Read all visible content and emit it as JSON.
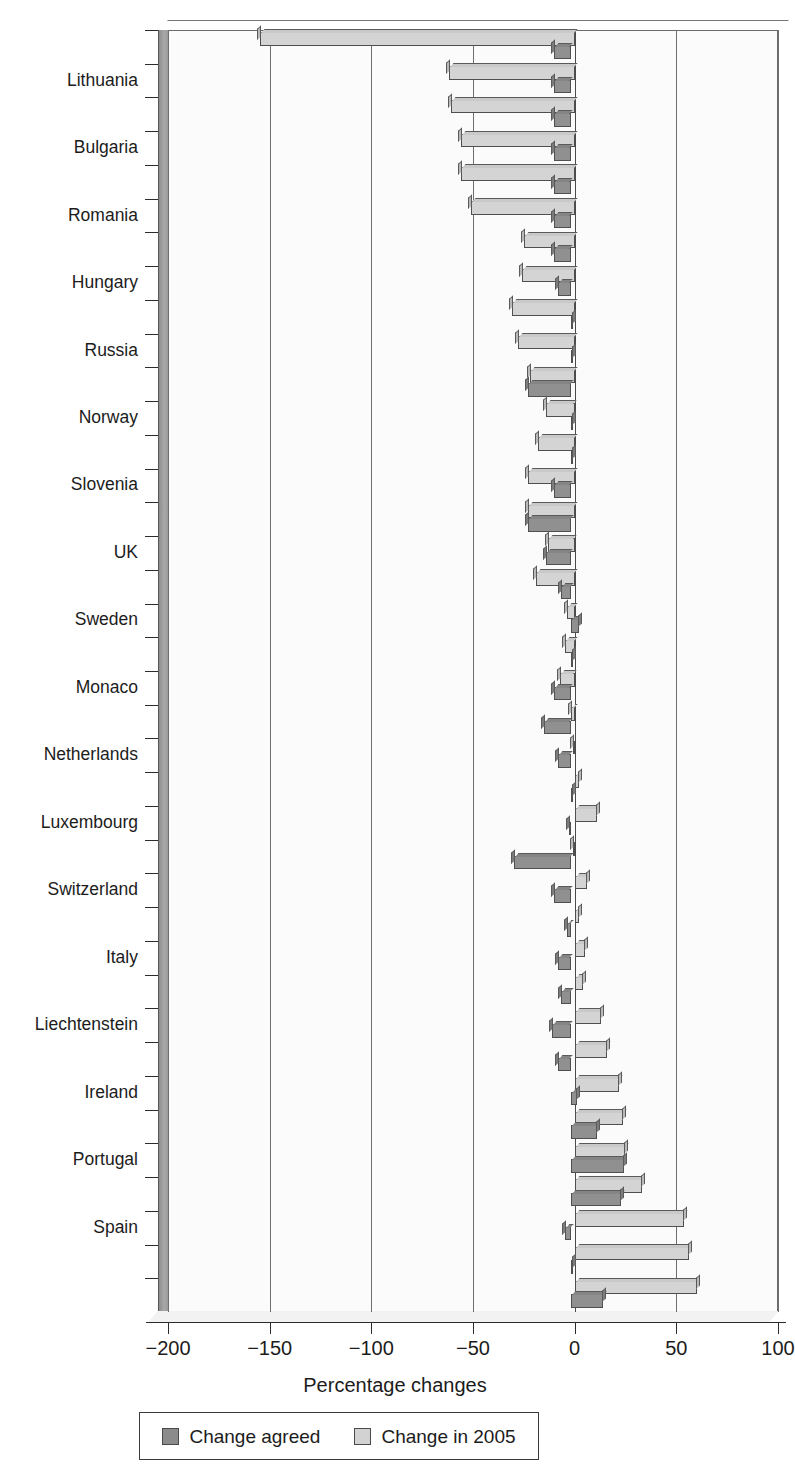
{
  "chart_data": {
    "type": "bar",
    "orientation": "horizontal",
    "title": "",
    "xlabel": "Percentage changes",
    "ylabel": "",
    "xlim": [
      -200,
      100
    ],
    "xticks": [
      -200,
      -150,
      -100,
      -50,
      0,
      50,
      100
    ],
    "xticklabels": [
      "−200",
      "−150",
      "−100",
      "−50",
      "0",
      "50",
      "100"
    ],
    "grid": "vertical",
    "legend_position": "bottom",
    "colors": {
      "change_agreed": "#909090",
      "change_2005": "#d4d4d4",
      "axis": "#2b2b2b",
      "grid": "#6f6f6f",
      "plot_background": "#fbfbfb",
      "wall": "#a0a0a0"
    },
    "legend": [
      {
        "key": "change_agreed",
        "label": "Change agreed",
        "swatch": "swatch-dark"
      },
      {
        "key": "change_2005",
        "label": "Change in 2005",
        "swatch": "swatch-light"
      }
    ],
    "series": [
      {
        "name": "Change agreed",
        "key": "change_agreed"
      },
      {
        "name": "Change in 2005",
        "key": "change_2005"
      }
    ],
    "categories": [
      "Estonia",
      "Lithuania",
      "Latvia",
      "Bulgaria",
      "Slovakia",
      "Romania",
      "Czech Republic",
      "Hungary",
      "Ukraine",
      "Russia",
      "Germany",
      "Norway",
      "Finland",
      "Slovenia",
      "Denmark",
      "UK",
      "Croatia",
      "Sweden",
      "Belarus",
      "Monaco",
      "Austria",
      "Netherlands",
      "France",
      "Luxembourg",
      "Belgium",
      "Switzerland",
      "Cyprus",
      "Italy",
      "Greece",
      "Liechtenstein",
      "Poland",
      "Ireland",
      "Malta",
      "Portugal",
      "Turkey",
      "Spain",
      "Iceland",
      "Albania"
    ],
    "rows": [
      {
        "label": "Estonia",
        "change_2005": -155,
        "change_agreed": -8
      },
      {
        "label": "Lithuania",
        "change_2005": -62,
        "change_agreed": -8
      },
      {
        "label": "Latvia",
        "change_2005": -61,
        "change_agreed": -8
      },
      {
        "label": "Bulgaria",
        "change_2005": -56,
        "change_agreed": -8
      },
      {
        "label": "Slovakia",
        "change_2005": -56,
        "change_agreed": -8
      },
      {
        "label": "Romania",
        "change_2005": -51,
        "change_agreed": -8
      },
      {
        "label": "Czech Republic",
        "change_2005": -25,
        "change_agreed": -8
      },
      {
        "label": "Hungary",
        "change_2005": -26,
        "change_agreed": -6
      },
      {
        "label": "Ukraine",
        "change_2005": -31,
        "change_agreed": 0
      },
      {
        "label": "Russia",
        "change_2005": -28,
        "change_agreed": 0
      },
      {
        "label": "Germany",
        "change_2005": -22,
        "change_agreed": -21
      },
      {
        "label": "Norway",
        "change_2005": -14,
        "change_agreed": 1
      },
      {
        "label": "Finland",
        "change_2005": -18,
        "change_agreed": 0
      },
      {
        "label": "Slovenia",
        "change_2005": -23,
        "change_agreed": -8
      },
      {
        "label": "Denmark",
        "change_2005": -23,
        "change_agreed": -21
      },
      {
        "label": "UK",
        "change_2005": -13,
        "change_agreed": -12
      },
      {
        "label": "Croatia",
        "change_2005": -19,
        "change_agreed": -5
      },
      {
        "label": "Sweden",
        "change_2005": -4,
        "change_agreed": 4
      },
      {
        "label": "Belarus",
        "change_2005": -5,
        "change_agreed": 0
      },
      {
        "label": "Monaco",
        "change_2005": -7,
        "change_agreed": -8
      },
      {
        "label": "Austria",
        "change_2005": -2,
        "change_agreed": -13
      },
      {
        "label": "Netherlands",
        "change_2005": -1,
        "change_agreed": -6
      },
      {
        "label": "France",
        "change_2005": 2,
        "change_agreed": 0
      },
      {
        "label": "Luxembourg",
        "change_2005": 11,
        "change_agreed": -1
      },
      {
        "label": "Belgium",
        "change_2005": -1,
        "change_agreed": -28
      },
      {
        "label": "Switzerland",
        "change_2005": 6,
        "change_agreed": -8
      },
      {
        "label": "Cyprus",
        "change_2005": 2,
        "change_agreed": -2
      },
      {
        "label": "Italy",
        "change_2005": 5,
        "change_agreed": -6
      },
      {
        "label": "Greece",
        "change_2005": 4,
        "change_agreed": -5
      },
      {
        "label": "Liechtenstein",
        "change_2005": 13,
        "change_agreed": -9
      },
      {
        "label": "Poland",
        "change_2005": 16,
        "change_agreed": -6
      },
      {
        "label": "Ireland",
        "change_2005": 22,
        "change_agreed": 3
      },
      {
        "label": "Malta",
        "change_2005": 24,
        "change_agreed": 13
      },
      {
        "label": "Portugal",
        "change_2005": 25,
        "change_agreed": 26
      },
      {
        "label": "Turkey",
        "change_2005": 33,
        "change_agreed": 25
      },
      {
        "label": "Spain",
        "change_2005": 54,
        "change_agreed": -3
      },
      {
        "label": "Iceland",
        "change_2005": 56,
        "change_agreed": 0
      },
      {
        "label": "Albania",
        "change_2005": 60,
        "change_agreed": 16
      }
    ],
    "visible_tick_labels": [
      "Lithuania",
      "Bulgaria",
      "Romania",
      "Hungary",
      "Russia",
      "Norway",
      "Slovenia",
      "UK",
      "Sweden",
      "Monaco",
      "Netherlands",
      "Luxembourg",
      "Switzerland",
      "Italy",
      "Liechtenstein",
      "Ireland",
      "Portugal",
      "Spain"
    ]
  }
}
